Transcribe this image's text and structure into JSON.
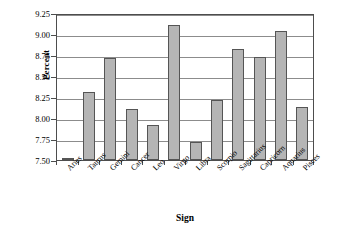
{
  "chart_data": {
    "type": "bar",
    "title": "",
    "xlabel": "Sign",
    "ylabel": "Percent",
    "categories": [
      "Aries",
      "Taurus",
      "Gemini",
      "Cancer",
      "Leo",
      "Virgo",
      "Libra",
      "Scorpio",
      "Sagittarius",
      "Capricorn",
      "Aquarius",
      "Pisces"
    ],
    "values": [
      7.51,
      8.31,
      8.71,
      8.11,
      7.92,
      9.11,
      7.72,
      8.22,
      8.82,
      8.73,
      9.03,
      8.13
    ],
    "ylim": [
      7.5,
      9.25
    ],
    "ytick_labels": [
      "7.50",
      "7.75",
      "8.00",
      "8.25",
      "8.50",
      "8.75",
      "9.00",
      "9.25"
    ],
    "ytick_values": [
      7.5,
      7.75,
      8.0,
      8.25,
      8.5,
      8.75,
      9.0,
      9.25
    ],
    "grid": true,
    "legend": false,
    "bar_color": "#b5b5b5",
    "bar_edge_color": "#555555",
    "grid_color": "#8c8c8c",
    "axis_color": "#4d4d4d",
    "background": "#ffffff"
  }
}
